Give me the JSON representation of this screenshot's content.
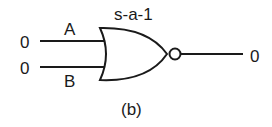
{
  "diagram": {
    "gate_type": "NOR",
    "fault_label": "s-a-1",
    "inputs": [
      {
        "name": "A",
        "value": "0"
      },
      {
        "name": "B",
        "value": "0"
      }
    ],
    "output": {
      "value": "0"
    },
    "caption": "(b)",
    "colors": {
      "stroke": "#1a1a1a",
      "background": "#ffffff"
    }
  }
}
